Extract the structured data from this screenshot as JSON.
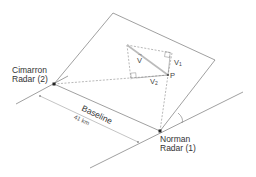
{
  "diagram": {
    "type": "dual-Doppler radar geometry",
    "colors": {
      "line": "#777777",
      "dashed": "#888888",
      "baseline_arrow": "#aaaaaa",
      "text": "#333333",
      "dot": "#222222"
    },
    "radars": [
      {
        "id": "cimarron",
        "name_line1": "Cimarron",
        "name_line2": "Radar (2)"
      },
      {
        "id": "norman",
        "name_line1": "Norman",
        "name_line2": "Radar (1)"
      }
    ],
    "baseline": {
      "label": "Baseline",
      "distance": "41 km"
    },
    "vectors": {
      "velocity": "V",
      "velocity_arrow": "→",
      "component_1": "V",
      "component_1_sub": "1",
      "component_2": "V",
      "component_2_sub": "2",
      "point": "P"
    }
  }
}
